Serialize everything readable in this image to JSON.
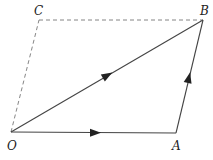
{
  "diagram": {
    "type": "parallelogram-vectors",
    "colors": {
      "line": "#444444",
      "dashed": "#777777",
      "label": "#222222",
      "background": "#ffffff"
    },
    "points": {
      "O": {
        "label": "O",
        "x": 11,
        "y": 132
      },
      "A": {
        "label": "A",
        "x": 176,
        "y": 133
      },
      "B": {
        "label": "B",
        "x": 203,
        "y": 20
      },
      "C": {
        "label": "C",
        "x": 39,
        "y": 20
      }
    },
    "edges": [
      {
        "from": "O",
        "to": "A",
        "style": "solid",
        "arrow": true
      },
      {
        "from": "A",
        "to": "B",
        "style": "solid",
        "arrow": true
      },
      {
        "from": "O",
        "to": "B",
        "style": "solid",
        "arrow": true
      },
      {
        "from": "O",
        "to": "C",
        "style": "dashed",
        "arrow": false
      },
      {
        "from": "C",
        "to": "B",
        "style": "dashed",
        "arrow": false
      }
    ],
    "labels": {
      "O": "O",
      "A": "A",
      "B": "B",
      "C": "C"
    }
  }
}
